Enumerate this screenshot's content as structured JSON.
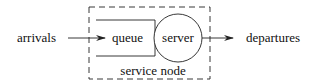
{
  "diagram": {
    "labels": {
      "arrivals": "arrivals",
      "queue": "queue",
      "server": "server",
      "departures": "departures",
      "service_node": "service node"
    },
    "colors": {
      "stroke": "#222222",
      "text": "#111111",
      "background": "#ffffff"
    }
  }
}
